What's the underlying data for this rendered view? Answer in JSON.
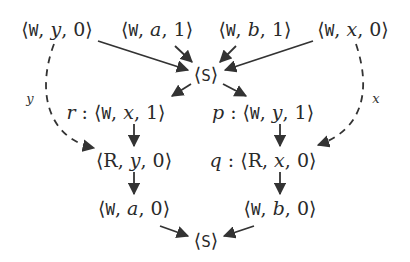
{
  "diagram": {
    "nodes": {
      "wy0": {
        "prefix": "",
        "kind": "W",
        "var": "y",
        "val": "0"
      },
      "wa1": {
        "prefix": "",
        "kind": "W",
        "var": "a",
        "val": "1"
      },
      "wb1": {
        "prefix": "",
        "kind": "W",
        "var": "b",
        "val": "1"
      },
      "wx0": {
        "prefix": "",
        "kind": "W",
        "var": "x",
        "val": "0"
      },
      "s_top": {
        "kind": "S"
      },
      "r": {
        "prefix": "r",
        "kind": "W",
        "var": "x",
        "val": "1"
      },
      "p": {
        "prefix": "p",
        "kind": "W",
        "var": "y",
        "val": "1"
      },
      "ry0": {
        "prefix": "",
        "kind": "R",
        "var": "y",
        "val": "0"
      },
      "q": {
        "prefix": "q",
        "kind": "R",
        "var": "x",
        "val": "0"
      },
      "wa0": {
        "prefix": "",
        "kind": "W",
        "var": "a",
        "val": "0"
      },
      "wb0": {
        "prefix": "",
        "kind": "W",
        "var": "b",
        "val": "0"
      },
      "s_bot": {
        "kind": "S"
      }
    },
    "edges": [
      {
        "from": "wy0",
        "to": "s_top",
        "style": "solid"
      },
      {
        "from": "wa1",
        "to": "s_top",
        "style": "solid"
      },
      {
        "from": "wb1",
        "to": "s_top",
        "style": "solid"
      },
      {
        "from": "wx0",
        "to": "s_top",
        "style": "solid"
      },
      {
        "from": "s_top",
        "to": "r",
        "style": "solid"
      },
      {
        "from": "s_top",
        "to": "p",
        "style": "solid"
      },
      {
        "from": "r",
        "to": "ry0",
        "style": "solid"
      },
      {
        "from": "p",
        "to": "q",
        "style": "solid"
      },
      {
        "from": "ry0",
        "to": "wa0",
        "style": "solid"
      },
      {
        "from": "q",
        "to": "wb0",
        "style": "solid"
      },
      {
        "from": "wa0",
        "to": "s_bot",
        "style": "solid"
      },
      {
        "from": "wb0",
        "to": "s_bot",
        "style": "solid"
      },
      {
        "from": "wy0",
        "to": "ry0",
        "style": "dashed",
        "label": "y"
      },
      {
        "from": "wx0",
        "to": "q",
        "style": "dashed",
        "label": "x"
      }
    ],
    "edge_labels": {
      "left": "y",
      "right": "x"
    },
    "colors": {
      "stroke": "#333333",
      "text": "#2a2a2a"
    }
  }
}
